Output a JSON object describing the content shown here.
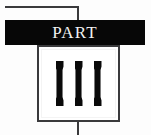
{
  "divider": {
    "kind": "part-divider",
    "part_label": "PART",
    "numeral": "III",
    "numeral_stroke_count": 3,
    "colors": {
      "bar_background": "#070707",
      "bar_text": "#f2f2f2",
      "rule": "#3a3a3c",
      "box_border": "#3a3a3c",
      "box_background": "#ffffff",
      "numeral": "#0a0a0a",
      "page_background": "#fdfdfd"
    },
    "strokes": [
      {
        "index": 1
      },
      {
        "index": 2
      },
      {
        "index": 3
      }
    ]
  }
}
